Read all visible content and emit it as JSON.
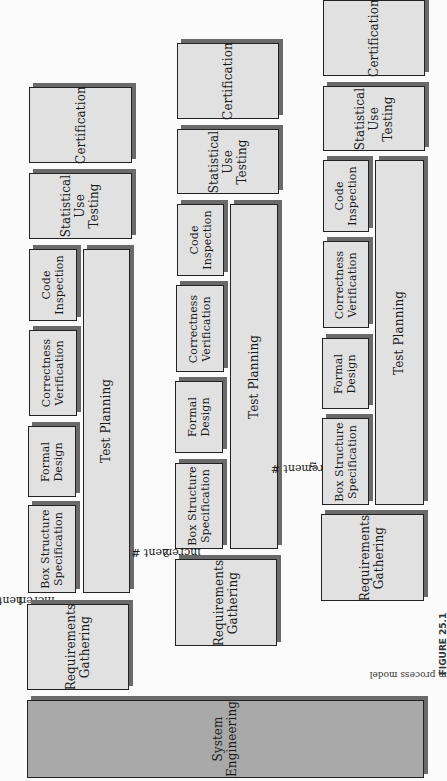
{
  "figure": {
    "caption_label": "FIGURE 25.1",
    "caption_text": "The cleanroom process model"
  },
  "system_engineering": {
    "label": "System\nEngineering",
    "color": "#a9a9a9"
  },
  "increments": [
    {
      "label_prefix": "increment #",
      "label_num": "1",
      "boxes": {
        "requirements": "Requirements\nGathering",
        "box_structure": "Box Structure\nSpecification",
        "formal_design": "Formal\nDesign",
        "correctness": "Correctness\nVerification",
        "code_inspection": "Code\nInspection",
        "test_planning": "Test Planning",
        "statistical_testing": "Statistical\nUse\nTesting",
        "certification": "Certification"
      }
    },
    {
      "label_prefix": "increment #",
      "label_num": "2",
      "boxes": {
        "requirements": "Requirements\nGathering",
        "box_structure": "Box Structure\nSpecification",
        "formal_design": "Formal\nDesign",
        "correctness": "Correctness\nVerification",
        "code_inspection": "Code\nInspection",
        "test_planning": "Test Planning",
        "statistical_testing": "Statistical\nUse\nTesting",
        "certification": "Certification"
      }
    },
    {
      "label_prefix": "increment #",
      "label_num": "n",
      "boxes": {
        "requirements": "Requirements\nGathering",
        "box_structure": "Box Structure\nSpecification",
        "formal_design": "Formal\nDesign",
        "correctness": "Correctness\nVerification",
        "code_inspection": "Code\nInspection",
        "test_planning": "Test Planning",
        "statistical_testing": "Statistical\nUse\nTesting",
        "certification": "Certification"
      }
    }
  ],
  "colors": {
    "box_fill": "#e1e1e1",
    "box_border": "#222222",
    "box_shadow": "#6a6a6a",
    "system_engineering_fill": "#a9a9a9"
  }
}
